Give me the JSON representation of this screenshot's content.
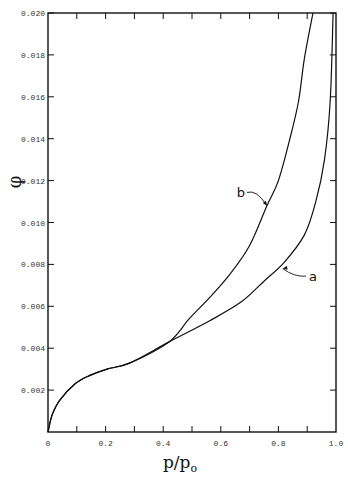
{
  "chart_data": {
    "type": "line",
    "title": "",
    "xlabel": "p/p0",
    "ylabel": "φ",
    "xlim": [
      0,
      1.0
    ],
    "ylim": [
      0,
      0.02
    ],
    "grid": false,
    "x_ticks": [
      0,
      0.1,
      0.2,
      0.3,
      0.4,
      0.5,
      0.6,
      0.7,
      0.8,
      0.9,
      1.0
    ],
    "x_tick_labels": [
      "0",
      "0.2",
      "0.4",
      "0.6",
      "0.8",
      "1.0"
    ],
    "x_tick_label_values": [
      0,
      0.2,
      0.4,
      0.6,
      0.8,
      1.0
    ],
    "y_ticks": [
      0.002,
      0.004,
      0.006,
      0.008,
      0.01,
      0.012,
      0.014,
      0.016,
      0.018,
      0.02
    ],
    "y_tick_labels": [
      "0.002",
      "0.004",
      "0.006",
      "0.008",
      "0.010",
      "0.012",
      "0.014",
      "0.016",
      "0.018",
      "0.020"
    ],
    "series": [
      {
        "name": "a",
        "x": [
          0,
          0.014,
          0.04,
          0.094,
          0.146,
          0.205,
          0.285,
          0.42,
          0.56,
          0.67,
          0.75,
          0.82,
          0.89,
          0.93,
          0.96,
          0.98,
          0.99
        ],
        "y": [
          0,
          0.0008,
          0.0015,
          0.0023,
          0.0027,
          0.003,
          0.0033,
          0.0043,
          0.0053,
          0.0062,
          0.0072,
          0.0081,
          0.0094,
          0.011,
          0.013,
          0.0158,
          0.02
        ],
        "label_pos": [
          0.92,
          0.0072
        ],
        "arrow_to": [
          0.815,
          0.0078
        ]
      },
      {
        "name": "b",
        "x": [
          0,
          0.014,
          0.04,
          0.094,
          0.146,
          0.205,
          0.285,
          0.42,
          0.49,
          0.56,
          0.63,
          0.7,
          0.76,
          0.8,
          0.84,
          0.87,
          0.89,
          0.92
        ],
        "y": [
          0,
          0.0008,
          0.0015,
          0.0023,
          0.0027,
          0.003,
          0.0033,
          0.0043,
          0.0054,
          0.0064,
          0.0075,
          0.0089,
          0.0108,
          0.012,
          0.014,
          0.0158,
          0.0178,
          0.02
        ],
        "label_pos": [
          0.67,
          0.0112
        ],
        "arrow_to": [
          0.76,
          0.0108
        ]
      }
    ]
  },
  "labels": {
    "xlabel_main": "p/p",
    "xlabel_sub": "o",
    "ylabel": "φ"
  }
}
